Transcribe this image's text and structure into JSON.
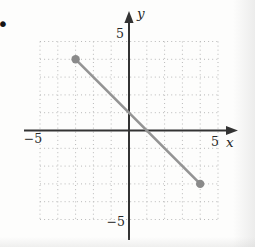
{
  "page": {
    "bullet_icon": "•"
  },
  "chart_data": {
    "type": "line",
    "title": "",
    "xlabel": "x",
    "ylabel": "y",
    "xlim": [
      -5,
      5
    ],
    "ylim": [
      -5,
      5
    ],
    "grid": true,
    "grid_style": "dotted",
    "grid_interval": 1,
    "x_tick_labels": [
      {
        "value": -5,
        "label": "−5"
      },
      {
        "value": 5,
        "label": "5"
      }
    ],
    "y_tick_labels": [
      {
        "value": 5,
        "label": "5"
      },
      {
        "value": -5,
        "label": "−5"
      }
    ],
    "series": [
      {
        "name": "line-segment",
        "points": [
          {
            "x": -3,
            "y": 4
          },
          {
            "x": 4,
            "y": -3
          }
        ],
        "endpoint_markers": "filled-circle"
      }
    ],
    "colors": {
      "segment": "#949494",
      "endpoint": "#8a8a8a",
      "axis": "#333333",
      "grid": "#b9b9b9",
      "text": "#272727"
    }
  }
}
